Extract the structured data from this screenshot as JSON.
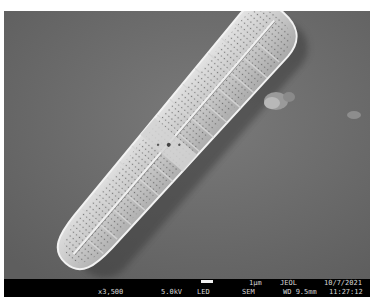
{
  "image": {
    "subject": "SEM micrograph of a pennate diatom frustule",
    "background_color": "#6f6f6f",
    "specimen_color": "#c8c8c8"
  },
  "databar": {
    "scale_label": "1µm",
    "manufacturer": "JEOL",
    "date": "10/7/2021",
    "magnification": "x3,500",
    "voltage": "5.0kV",
    "detector": "LED",
    "mode": "SEM",
    "working_distance": "WD 9.5mm",
    "time": "11:27:12"
  }
}
